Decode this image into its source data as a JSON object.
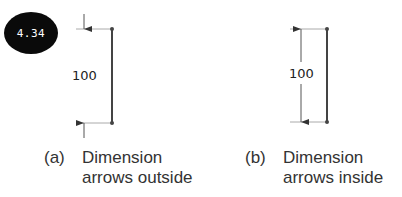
{
  "badge": {
    "label": "4.34"
  },
  "figure_a": {
    "dimension_value": "100",
    "caption_label": "(a)",
    "caption_line1": "Dimension",
    "caption_line2": "arrows outside"
  },
  "figure_b": {
    "dimension_value": "100",
    "caption_label": "(b)",
    "caption_line1": "Dimension",
    "caption_line2": "arrows inside"
  },
  "colors": {
    "line": "#444444",
    "extension": "#aaaaaa",
    "badge_bg": "#0a0a0a"
  }
}
